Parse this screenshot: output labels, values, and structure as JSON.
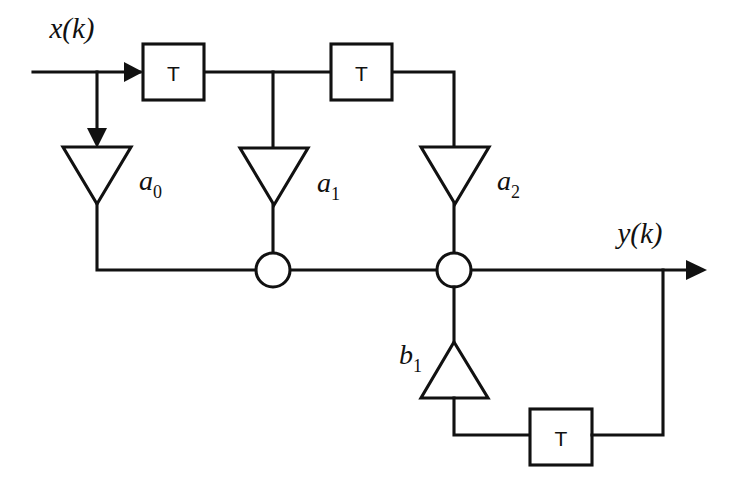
{
  "diagram": {
    "type": "block-diagram",
    "background_color": "#ffffff",
    "line_color": "#111111",
    "signals": {
      "input_label": "x(k)",
      "output_label": "y(k)"
    },
    "delay_blocks": [
      {
        "id": "delay-1",
        "label": "T",
        "x": 143,
        "y": 44,
        "w": 61,
        "h": 56
      },
      {
        "id": "delay-2",
        "label": "T",
        "x": 331,
        "y": 44,
        "w": 61,
        "h": 56
      },
      {
        "id": "delay-feedback",
        "label": "T",
        "x": 530,
        "y": 409,
        "w": 62,
        "h": 56
      }
    ],
    "gain_blocks": [
      {
        "id": "gain-a0",
        "symbol": "a",
        "subscript": "0",
        "direction": "down",
        "label_x": 139,
        "label_y": 190
      },
      {
        "id": "gain-a1",
        "symbol": "a",
        "subscript": "1",
        "direction": "down",
        "label_x": 317,
        "label_y": 192
      },
      {
        "id": "gain-a2",
        "symbol": "a",
        "subscript": "2",
        "direction": "down",
        "label_x": 497,
        "label_y": 190
      },
      {
        "id": "gain-b1",
        "symbol": "b",
        "subscript": "1",
        "direction": "up",
        "label_x": 399,
        "label_y": 364
      }
    ],
    "summing_junctions": [
      {
        "id": "sum-1",
        "cx": 273,
        "cy": 270,
        "r": 17
      },
      {
        "id": "sum-2",
        "cx": 454,
        "cy": 270,
        "r": 17
      }
    ],
    "label_positions": {
      "input": {
        "x": 72,
        "y": 38
      },
      "output": {
        "x": 640,
        "y": 243
      }
    }
  }
}
